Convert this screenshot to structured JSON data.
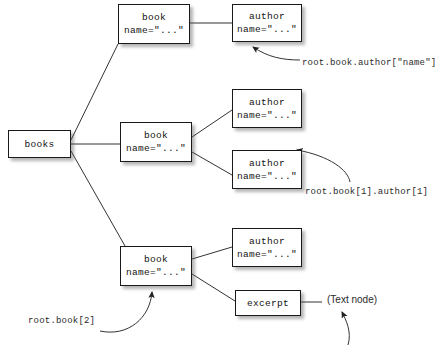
{
  "diagram": {
    "background_color": "#ffffff",
    "line_color": "#333333",
    "box_border_color": "#1a1a1a",
    "nodes": [
      {
        "id": "books",
        "line1": "books",
        "line2": "",
        "x": 8,
        "y": 130,
        "w": 63,
        "h": 28
      },
      {
        "id": "book0",
        "line1": "book",
        "line2": "name=\"...\"",
        "x": 118,
        "y": 4,
        "w": 72,
        "h": 40
      },
      {
        "id": "author0",
        "line1": "author",
        "line2": "name=\"...\"",
        "x": 232,
        "y": 4,
        "w": 70,
        "h": 38
      },
      {
        "id": "book1",
        "line1": "book",
        "line2": "name=\"...\"",
        "x": 120,
        "y": 122,
        "w": 72,
        "h": 40
      },
      {
        "id": "author1a",
        "line1": "author",
        "line2": "name=\"...\"",
        "x": 232,
        "y": 89,
        "w": 70,
        "h": 39
      },
      {
        "id": "author1b",
        "line1": "author",
        "line2": "name=\"...\"",
        "x": 232,
        "y": 150,
        "w": 70,
        "h": 39
      },
      {
        "id": "book2",
        "line1": "book",
        "line2": "name=\"...\"",
        "x": 120,
        "y": 246,
        "w": 72,
        "h": 40
      },
      {
        "id": "author2",
        "line1": "author",
        "line2": "name=\"...\"",
        "x": 232,
        "y": 228,
        "w": 70,
        "h": 39
      },
      {
        "id": "excerpt",
        "line1": "excerpt",
        "line2": "",
        "x": 235,
        "y": 290,
        "w": 66,
        "h": 26
      }
    ],
    "annotations": [
      {
        "id": "ann-author-name",
        "text": "root.book.author[\"name\"]",
        "x": 302,
        "y": 57,
        "font": "mono"
      },
      {
        "id": "ann-book1-author1",
        "text": "root.book[1].author[1]",
        "x": 305,
        "y": 186,
        "font": "mono"
      },
      {
        "id": "ann-book2",
        "text": "root.book[2]",
        "x": 28,
        "y": 315,
        "font": "mono"
      },
      {
        "id": "ann-text-node",
        "text": "(Text node)",
        "x": 327,
        "y": 294,
        "font": "sans"
      }
    ]
  }
}
